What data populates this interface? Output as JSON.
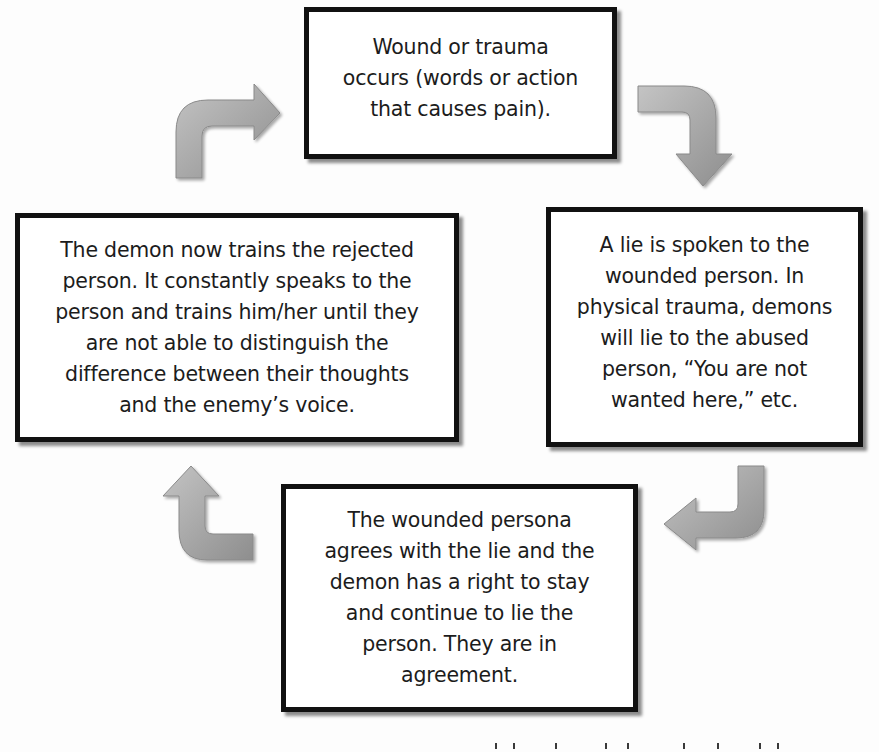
{
  "diagram": {
    "type": "cycle",
    "arrow_color": "#9e9e9e",
    "border_color": "#111111",
    "nodes": [
      {
        "id": "wound",
        "position": "top",
        "lines": [
          "Wound or trauma",
          "occurs (words or action",
          "that causes pain)."
        ]
      },
      {
        "id": "lie",
        "position": "right",
        "lines": [
          "A lie is spoken to the",
          "wounded person. In",
          "physical trauma, demons",
          "will lie to the abused",
          "person, “You are not",
          "wanted here,” etc."
        ]
      },
      {
        "id": "agreement",
        "position": "bottom",
        "lines": [
          "The wounded persona",
          "agrees with the lie and the",
          "demon has a right to stay",
          "and continue to lie the",
          "person. They are in",
          "agreement."
        ]
      },
      {
        "id": "training",
        "position": "left",
        "lines": [
          "The demon now trains the rejected",
          "person. It constantly speaks to the",
          "person and trains him/her until they",
          "are not able to distinguish the",
          "difference between their thoughts",
          "and the enemy’s voice."
        ]
      }
    ],
    "edges": [
      {
        "from": "wound",
        "to": "lie",
        "icon": "curved-arrow-down-right"
      },
      {
        "from": "lie",
        "to": "agreement",
        "icon": "curved-arrow-down-left"
      },
      {
        "from": "agreement",
        "to": "training",
        "icon": "curved-arrow-up-left"
      },
      {
        "from": "training",
        "to": "wound",
        "icon": "curved-arrow-up-right"
      }
    ]
  }
}
